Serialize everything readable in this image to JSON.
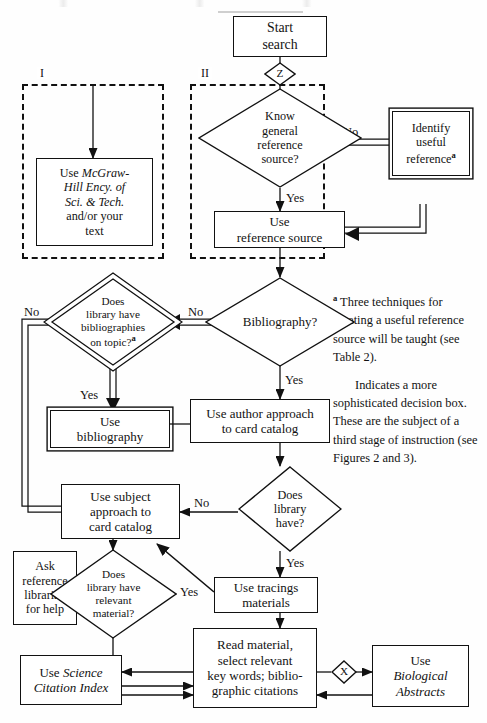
{
  "figure": {
    "type": "flowchart",
    "regions": [
      {
        "id": "I",
        "label": "I"
      },
      {
        "id": "II",
        "label": "II"
      }
    ]
  },
  "nodes": {
    "start": {
      "text": "Start\nsearch",
      "shape": "box"
    },
    "connector_z": {
      "text": "Z",
      "shape": "small-diamond"
    },
    "know_general": {
      "text": "Know\ngeneral\nreference\nsource?",
      "shape": "diamond"
    },
    "identify_useful": {
      "text": "Identify\nuseful\nreference",
      "sup": "a",
      "shape": "double-box"
    },
    "use_reference_source": {
      "text": "Use\nreference source",
      "shape": "box"
    },
    "mcgraw": {
      "line1": "Use ",
      "line1_italic": "McGraw-",
      "line2_italic": "Hill Ency. of",
      "line3_italic": "Sci. & Tech.",
      "line4": "and/or your",
      "line5": "text",
      "shape": "box"
    },
    "bibliography_q": {
      "text": "Bibliography?",
      "shape": "diamond"
    },
    "library_bibs_q": {
      "text": "Does\nlibrary have\nbibliographies\non topic?",
      "sup": "a",
      "shape": "double-diamond"
    },
    "use_bibliography": {
      "text": "Use\nbibliography",
      "shape": "double-box"
    },
    "author_approach": {
      "text": "Use author approach\nto card catalog",
      "shape": "box"
    },
    "does_library_have_q": {
      "text": "Does\nlibrary\nhave?",
      "shape": "diamond"
    },
    "subject_approach": {
      "text": "Use subject\napproach to\ncard catalog",
      "shape": "box"
    },
    "relevant_material_q": {
      "text": "Does\nlibrary have\nrelevant\nmaterial?",
      "shape": "diamond"
    },
    "ask_librarian": {
      "text": "Ask\nreference\nlibrarian\nfor help",
      "shape": "box"
    },
    "use_tracings": {
      "text": "Use tracings\nmaterials",
      "shape": "box"
    },
    "read_material": {
      "text": "Read material,\nselect relevant\nkey words; biblio-\ngraphic citations",
      "shape": "box"
    },
    "connector_x": {
      "text": "X",
      "shape": "small-diamond"
    },
    "science_citation": {
      "line1": "Use ",
      "line1_italic": "Science",
      "line2_italic": "Citation Index",
      "shape": "box"
    },
    "biological_abstracts": {
      "line1": "Use",
      "line2_italic": "Biological",
      "line3_italic": "Abstracts",
      "shape": "box"
    }
  },
  "edge_labels": {
    "know_no": "No",
    "know_yes": "Yes",
    "bibliography_no": "No",
    "bibliography_yes": "Yes",
    "library_bibs_no": "No",
    "library_bibs_yes": "Yes",
    "does_library_have_no": "No",
    "does_library_have_yes": "Yes",
    "relevant_no": "No",
    "relevant_yes": "Yes"
  },
  "notes": {
    "note_a_marker": "a",
    "note_a": " Three techniques for locating a useful reference source will be taught (see Table 2).",
    "note_b": "Indicates a more sophisticated decision box. These are the subject of a third stage of instruction (see Figures 2 and 3)."
  },
  "colors": {
    "ink": "#121212",
    "paper": "#fefefe",
    "stroke": "#111111"
  }
}
